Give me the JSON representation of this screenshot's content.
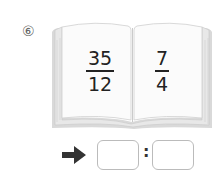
{
  "problem": {
    "number_label": "⑥",
    "left_page": {
      "numerator": "35",
      "denominator": "12"
    },
    "right_page": {
      "numerator": "7",
      "denominator": "4"
    },
    "answer": {
      "arrow_icon": "arrow-right-icon",
      "separator": ":",
      "first_value": "",
      "second_value": ""
    }
  }
}
